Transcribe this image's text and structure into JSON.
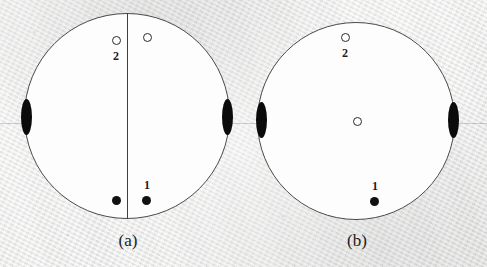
{
  "figure": {
    "kind": "stereographic-projection-pole-figure-pair",
    "background_color": "#ececeb",
    "outline_color": "#4a4a4a",
    "marker_color": "#111111",
    "panel_count": 2
  },
  "panels": [
    {
      "id": "a",
      "caption": "(a)",
      "caption_x": 118,
      "caption_y": 237,
      "circle": {
        "cx": 127,
        "cy": 116,
        "r": 103
      },
      "has_divider": true,
      "divider": {
        "x": 127,
        "y_top": 13,
        "y_bottom": 219
      },
      "markers": [
        {
          "name": "open-pole-upper-left",
          "type": "open",
          "cx": 116,
          "cy": 40
        },
        {
          "name": "open-pole-upper-right",
          "type": "open",
          "cx": 147,
          "cy": 38
        },
        {
          "name": "filled-pole-lower-left",
          "type": "filled",
          "cx": 116,
          "cy": 200
        },
        {
          "name": "filled-pole-lower-right",
          "type": "filled",
          "cx": 146,
          "cy": 200
        },
        {
          "name": "lens-pole-west",
          "type": "lens",
          "cx": 26,
          "cy": 117
        },
        {
          "name": "lens-pole-east",
          "type": "lens",
          "cx": 227,
          "cy": 117
        }
      ],
      "labels": [
        {
          "name": "pole-label-2",
          "text": "2",
          "x": 116,
          "y": 54
        },
        {
          "name": "pole-label-1",
          "text": "1",
          "x": 146,
          "y": 183
        }
      ]
    },
    {
      "id": "b",
      "caption": "(b)",
      "caption_x": 347,
      "caption_y": 237,
      "circle": {
        "cx": 356,
        "cy": 121,
        "r": 99
      },
      "has_divider": false,
      "divider": null,
      "markers": [
        {
          "name": "open-pole-upper",
          "type": "open",
          "cx": 345,
          "cy": 37
        },
        {
          "name": "open-pole-center",
          "type": "open",
          "cx": 357,
          "cy": 121
        },
        {
          "name": "filled-pole-lower",
          "type": "filled",
          "cx": 374,
          "cy": 201
        },
        {
          "name": "lens-pole-west",
          "type": "lens",
          "cx": 261,
          "cy": 120
        },
        {
          "name": "lens-pole-east",
          "type": "lens",
          "cx": 453,
          "cy": 120
        }
      ],
      "labels": [
        {
          "name": "pole-label-2",
          "text": "2",
          "x": 345,
          "y": 51
        },
        {
          "name": "pole-label-1",
          "text": "1",
          "x": 374,
          "y": 184
        }
      ]
    }
  ],
  "scan_line": {
    "y": 123,
    "color": "#828282"
  }
}
